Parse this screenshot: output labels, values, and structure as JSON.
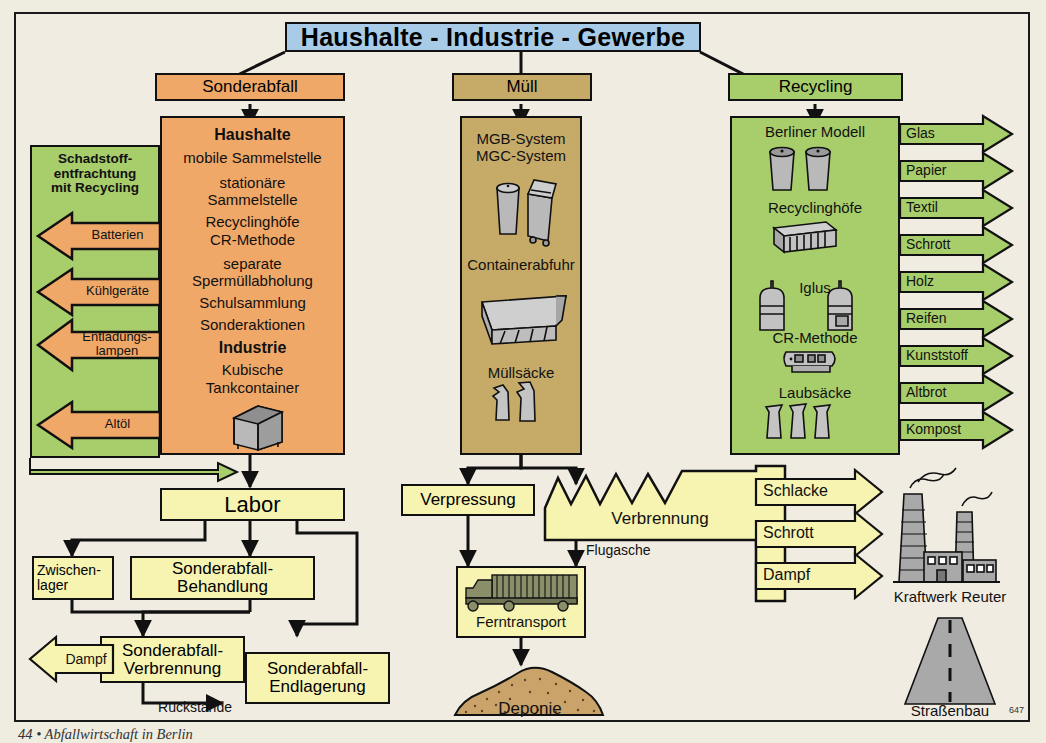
{
  "page": {
    "number": "647",
    "caption": "44 • Abfallwirtschaft in Berlin"
  },
  "colors": {
    "background": "#f0ece1",
    "header_blue": "#a8cce8",
    "sonderabfall_orange": "#f0a868",
    "muell_tan": "#c6ab68",
    "recycling_green": "#a8cd6b",
    "process_yellow": "#f7f3b0",
    "outline": "#111111",
    "deponie_brown": "#c9a36a",
    "icon_grey": "#b4b4b4"
  },
  "header": {
    "title": "Haushalte - Industrie - Gewerbe"
  },
  "columns": [
    {
      "key": "sonderabfall",
      "title": "Sonderabfall",
      "panel_lines": [
        "Haushalte",
        "mobile Sammelstelle",
        "stationäre",
        "Sammelstelle",
        "Recyclinghöfe",
        "CR-Methode",
        "separate",
        "Spermüllabholung",
        "Schulsammlung",
        "Sonderaktionen",
        "Industrie",
        "Kubische",
        "Tankcontainer"
      ],
      "icon": "tank-container-icon"
    },
    {
      "key": "muell",
      "title": "Müll",
      "panel_lines": [
        "MGB-System",
        "MGC-System",
        "Containerabfuhr",
        "Müllsäcke"
      ],
      "icons": [
        "dustbin-icon",
        "wheelie-bin-icon",
        "skip-container-icon",
        "rubbish-bag-icon"
      ]
    },
    {
      "key": "recycling",
      "title": "Recycling",
      "panel_lines": [
        "Berliner Modell",
        "Recyclinghöfe",
        "Iglus",
        "CR-Methode",
        "Laubsäcke"
      ],
      "icons": [
        "recycling-bin-icon",
        "recycling-yard-icon",
        "igloo-container-icon",
        "cr-vehicle-icon",
        "leaf-sack-icon"
      ]
    }
  ],
  "schadstoff": {
    "title": "Schadstoff-\nentfrachtung\nmit Recycling",
    "arrows": [
      "Batterien",
      "Kühlgeräte",
      "Entladungs-\nlampen",
      "Altöl"
    ]
  },
  "recycling_outputs": [
    "Glas",
    "Papier",
    "Textil",
    "Schrott",
    "Holz",
    "Reifen",
    "Kunststoff",
    "Altbrot",
    "Kompost"
  ],
  "lab_flow": {
    "labor": "Labor",
    "zwischenlager": "Zwischen-\nlager",
    "behandlung": "Sonderabfall-\nBehandlung",
    "verbrennung": "Sonderabfall-\nVerbrennung",
    "endlagerung": "Sonderabfall-\nEndlagerung",
    "dampf": "Dampf",
    "rueckstaende": "Rückstände"
  },
  "waste_flow": {
    "verpressung": "Verpressung",
    "verbrennung": "Verbrennung",
    "flugasche": "Flugasche",
    "ferntransport": "Ferntransport",
    "deponie": "Deponie"
  },
  "incineration_outputs": [
    "Schlacke",
    "Schrott",
    "Dampf"
  ],
  "destinations": [
    {
      "label": "Kraftwerk Reuter",
      "icon": "power-plant-icon"
    },
    {
      "label": "Straßenbau",
      "icon": "road-icon"
    }
  ]
}
